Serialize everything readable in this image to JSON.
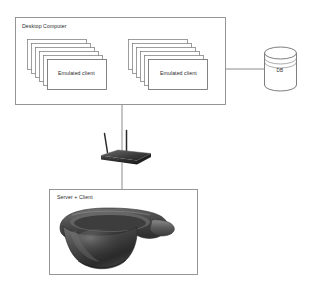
{
  "diagram": {
    "title_hidden": "",
    "nodes": {
      "desktop_computer": {
        "label": "Desktop Computer",
        "name": "desktop-computer-box"
      },
      "emulated_client_left": {
        "label": "Emulated client",
        "stack_count": 6
      },
      "emulated_client_right": {
        "label": "Emulated client",
        "stack_count": 6
      },
      "database": {
        "label": "DB",
        "shape": "cylinder"
      },
      "router": {
        "label": "",
        "icon": "wireless-router-icon",
        "antenna_count": 2
      },
      "server_client": {
        "label": "Server + Client",
        "device_icon": "hololens-headset-icon"
      }
    },
    "connections": [
      {
        "from": "desktop_computer",
        "to": "database",
        "style": "solid"
      },
      {
        "from": "desktop_computer",
        "to": "router",
        "style": "solid"
      },
      {
        "from": "router",
        "to": "server_client",
        "style": "solid"
      }
    ],
    "colors": {
      "stroke": "#6e6e6e",
      "box_stroke": "#8a8a8a",
      "card_fill": "#ffffff",
      "text": "#2b2b2b",
      "router_dark": "#2e2e2e",
      "headset_dark": "#3a3a3a",
      "background": "#ffffff"
    }
  }
}
